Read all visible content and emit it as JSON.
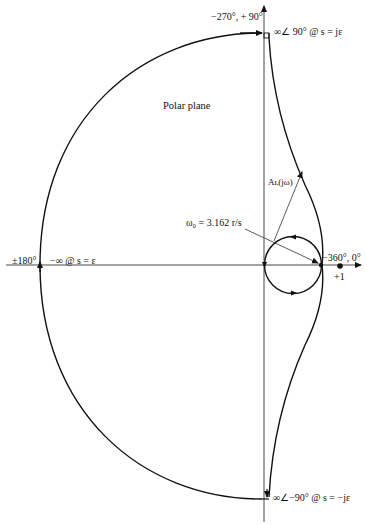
{
  "diagram": {
    "type": "Nyquist polar plot",
    "title": "Polar plane",
    "labels": {
      "top_axis": "−270°, + 90°",
      "top_right": "∞∠ 90° @ s = jε",
      "left_axis": "±180°",
      "left_inf": "−∞ @ s = ε",
      "right_axis": "−360°, 0°",
      "plus_one": "+1",
      "bottom_right": "∞∠−90° @ s = −jε",
      "magnitude": "Aʟ(jω)",
      "crossover": "ω₀ = 3.162 r/s"
    },
    "colors": {
      "stroke": "#111111",
      "background": "#ffffff"
    }
  }
}
